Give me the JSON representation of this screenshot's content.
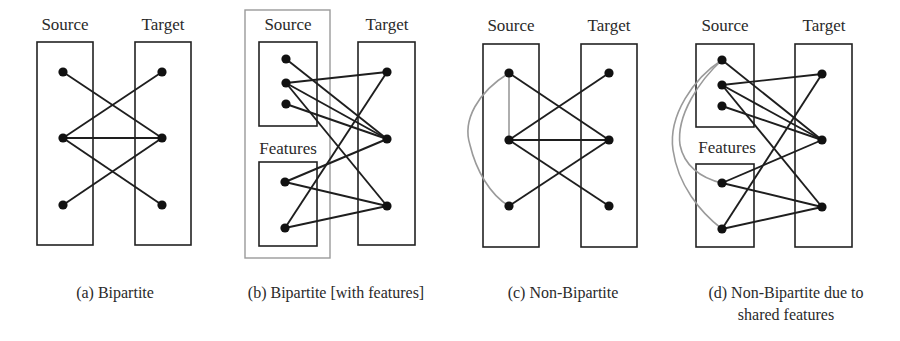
{
  "panels": [
    {
      "id": "a",
      "caption": [
        "(a) Bipartite"
      ],
      "caption_x": 115,
      "source_label": "Source",
      "target_label": "Target",
      "features_label": null,
      "outer_box": null,
      "boxes": [
        {
          "role": "source",
          "x": 37,
          "y": 42,
          "w": 56,
          "h": 203
        },
        {
          "role": "target",
          "x": 135,
          "y": 42,
          "w": 56,
          "h": 203
        }
      ],
      "label_positions": {
        "source": [
          65,
          30
        ],
        "target": [
          163,
          30
        ]
      },
      "nodes": {
        "S1": [
          63,
          72
        ],
        "S2": [
          63,
          138
        ],
        "S3": [
          63,
          205
        ],
        "T1": [
          162,
          72
        ],
        "T2": [
          162,
          138
        ],
        "T3": [
          162,
          205
        ]
      },
      "edges": [
        [
          "S1",
          "T2"
        ],
        [
          "S2",
          "T1"
        ],
        [
          "S2",
          "T2"
        ],
        [
          "S2",
          "T3"
        ],
        [
          "S3",
          "T2"
        ]
      ],
      "gray_edges": []
    },
    {
      "id": "b",
      "caption": [
        "(b) Bipartite [with features]"
      ],
      "caption_x": 336,
      "source_label": "Source",
      "target_label": "Target",
      "features_label": "Features",
      "outer_box": {
        "x": 245,
        "y": 10,
        "w": 85,
        "h": 248
      },
      "boxes": [
        {
          "role": "source",
          "x": 259,
          "y": 42,
          "w": 58,
          "h": 84
        },
        {
          "role": "features",
          "x": 259,
          "y": 162,
          "w": 58,
          "h": 84
        },
        {
          "role": "target",
          "x": 358,
          "y": 42,
          "w": 57,
          "h": 203
        }
      ],
      "label_positions": {
        "source": [
          288,
          30
        ],
        "target": [
          387,
          30
        ],
        "features": [
          288,
          154
        ]
      },
      "nodes": {
        "S1": [
          286,
          59
        ],
        "S2": [
          286,
          83
        ],
        "S3": [
          286,
          104
        ],
        "F1": [
          285,
          182
        ],
        "F2": [
          285,
          228
        ],
        "T1": [
          387,
          72
        ],
        "T2": [
          387,
          139
        ],
        "T3": [
          387,
          206
        ]
      },
      "edges": [
        [
          "S1",
          "T2"
        ],
        [
          "S2",
          "T1"
        ],
        [
          "S2",
          "T2"
        ],
        [
          "S2",
          "T3"
        ],
        [
          "S3",
          "T2"
        ],
        [
          "F1",
          "T2"
        ],
        [
          "F1",
          "T3"
        ],
        [
          "F2",
          "T1"
        ],
        [
          "F2",
          "T3"
        ]
      ],
      "gray_edges": []
    },
    {
      "id": "c",
      "caption": [
        "(c) Non-Bipartite"
      ],
      "caption_x": 563,
      "source_label": "Source",
      "target_label": "Target",
      "features_label": null,
      "outer_box": null,
      "boxes": [
        {
          "role": "source",
          "x": 483,
          "y": 44,
          "w": 56,
          "h": 203
        },
        {
          "role": "target",
          "x": 581,
          "y": 44,
          "w": 56,
          "h": 203
        }
      ],
      "label_positions": {
        "source": [
          511,
          31
        ],
        "target": [
          609,
          31
        ]
      },
      "nodes": {
        "S1": [
          509,
          73
        ],
        "S2": [
          509,
          140
        ],
        "S3": [
          509,
          206
        ],
        "T1": [
          609,
          73
        ],
        "T2": [
          609,
          140
        ],
        "T3": [
          609,
          206
        ]
      },
      "edges": [
        [
          "S1",
          "T2"
        ],
        [
          "S2",
          "T1"
        ],
        [
          "S2",
          "T2"
        ],
        [
          "S2",
          "T3"
        ],
        [
          "S3",
          "T2"
        ]
      ],
      "gray_edges": [
        {
          "from": "S1",
          "to": "S2",
          "d": "M509,73 L509,140"
        },
        {
          "from": "S1",
          "to": "S3",
          "d": "M509,73 C478,92 462,120 470,145 C476,170 490,195 509,206"
        }
      ]
    },
    {
      "id": "d",
      "caption": [
        "(d) Non-Bipartite due to",
        "shared features"
      ],
      "caption_x": 786,
      "source_label": "Source",
      "target_label": "Target",
      "features_label": "Features",
      "outer_box": null,
      "boxes": [
        {
          "role": "source",
          "x": 696,
          "y": 44,
          "w": 58,
          "h": 83
        },
        {
          "role": "features",
          "x": 696,
          "y": 164,
          "w": 58,
          "h": 83
        },
        {
          "role": "target",
          "x": 795,
          "y": 44,
          "w": 57,
          "h": 203
        }
      ],
      "label_positions": {
        "source": [
          725,
          31
        ],
        "target": [
          824,
          31
        ],
        "features": [
          727,
          153
        ]
      },
      "nodes": {
        "S1": [
          722,
          60
        ],
        "S2": [
          722,
          85
        ],
        "S3": [
          722,
          106
        ],
        "F1": [
          722,
          183
        ],
        "F2": [
          722,
          229
        ],
        "T1": [
          822,
          74
        ],
        "T2": [
          822,
          140
        ],
        "T3": [
          822,
          207
        ]
      },
      "edges": [
        [
          "S1",
          "T2"
        ],
        [
          "S2",
          "T1"
        ],
        [
          "S2",
          "T2"
        ],
        [
          "S2",
          "T3"
        ],
        [
          "S3",
          "T2"
        ],
        [
          "F1",
          "T2"
        ],
        [
          "F1",
          "T3"
        ],
        [
          "F2",
          "T1"
        ],
        [
          "F2",
          "T3"
        ]
      ],
      "gray_edges": [
        {
          "from": "S1",
          "to": "F1",
          "d": "M722,60 C700,80 676,115 680,145 C684,165 700,178 722,183"
        },
        {
          "from": "S1",
          "to": "F2",
          "d": "M722,60 C694,78 668,115 673,150 C678,185 700,212 722,229"
        }
      ]
    }
  ],
  "colors": {
    "edge": "#1e1e1e",
    "gray_edge": "#9a9a9a",
    "node": "#111111",
    "box": "#222222",
    "outer_box": "#9a9a9a"
  }
}
